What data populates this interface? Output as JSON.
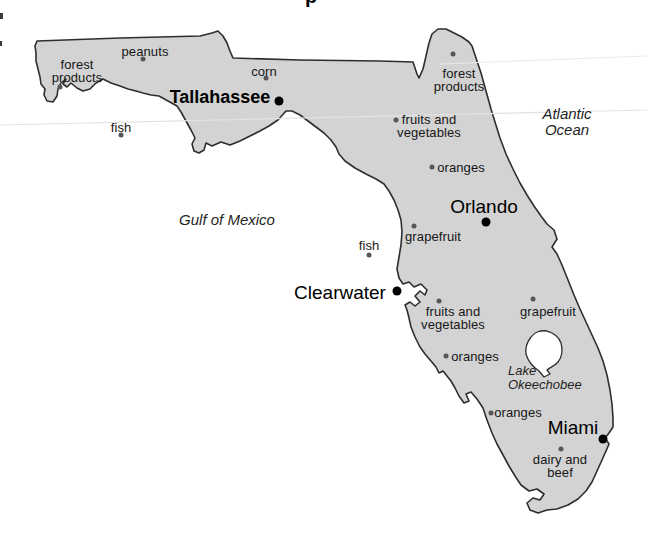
{
  "title_fragment": {
    "text": "p"
  },
  "map": {
    "name": "Florida products map",
    "colors": {
      "land": "#d3d3d3",
      "outline": "#2e2e2e",
      "water": "#ffffff",
      "product_dot": "#565656",
      "city_dot": "#000000",
      "faint_rule": "#e2e2e2"
    },
    "water_labels": [
      {
        "id": "gulf-of-mexico",
        "text": "Gulf of Mexico",
        "x": 227,
        "y": 220,
        "size": 15
      },
      {
        "id": "atlantic-ocean",
        "text": "Atlantic Ocean",
        "x": 567,
        "y": 122,
        "size": 15
      },
      {
        "id": "lake-okeechobee",
        "text": "Lake\nOkeechobee",
        "x": 508,
        "y": 378,
        "size": 13,
        "align": "left"
      }
    ],
    "cities": [
      {
        "id": "tallahassee",
        "name": "Tallahassee",
        "bold": true,
        "size": 18,
        "label": {
          "x": 220,
          "y": 97
        },
        "dot": {
          "x": 279,
          "y": 101
        }
      },
      {
        "id": "orlando",
        "name": "Orlando",
        "bold": false,
        "size": 19,
        "label": {
          "x": 484,
          "y": 206
        },
        "dot": {
          "x": 486,
          "y": 222
        }
      },
      {
        "id": "clearwater",
        "name": "Clearwater",
        "bold": false,
        "size": 19,
        "label": {
          "x": 340,
          "y": 292
        },
        "dot": {
          "x": 397,
          "y": 291
        }
      },
      {
        "id": "miami",
        "name": "Miami",
        "bold": false,
        "size": 19,
        "label": {
          "x": 573,
          "y": 427
        },
        "dot": {
          "x": 603,
          "y": 439
        }
      }
    ],
    "products": [
      {
        "id": "peanuts",
        "text": "peanuts",
        "label": {
          "x": 145,
          "y": 51
        },
        "dot": {
          "x": 143,
          "y": 59
        }
      },
      {
        "id": "forest-products-west",
        "text": "forest\nproducts",
        "label": {
          "x": 77,
          "y": 71
        },
        "dot": {
          "x": 60,
          "y": 87
        }
      },
      {
        "id": "corn",
        "text": "corn",
        "label": {
          "x": 264,
          "y": 71
        },
        "dot": {
          "x": 266,
          "y": 78
        }
      },
      {
        "id": "forest-products-north",
        "text": "forest\nproducts",
        "label": {
          "x": 459,
          "y": 80
        },
        "dot": {
          "x": 453,
          "y": 54
        }
      },
      {
        "id": "fish-panhandle",
        "text": "fish",
        "label": {
          "x": 121,
          "y": 127
        },
        "dot": {
          "x": 121,
          "y": 135
        }
      },
      {
        "id": "fruits-vegetables-north",
        "text": "fruits and\nvegetables",
        "label": {
          "x": 429,
          "y": 126
        },
        "dot": {
          "x": 396,
          "y": 120
        }
      },
      {
        "id": "oranges-north",
        "text": "oranges",
        "label": {
          "x": 461,
          "y": 167
        },
        "dot": {
          "x": 432,
          "y": 167
        }
      },
      {
        "id": "grapefruit-west",
        "text": "grapefruit",
        "label": {
          "x": 433,
          "y": 236
        },
        "dot": {
          "x": 414,
          "y": 226
        }
      },
      {
        "id": "fish-gulf",
        "text": "fish",
        "label": {
          "x": 369,
          "y": 245
        },
        "dot": {
          "x": 369,
          "y": 255
        }
      },
      {
        "id": "fruits-vegetables-tampa",
        "text": "fruits and\nvegetables",
        "label": {
          "x": 453,
          "y": 318
        },
        "dot": {
          "x": 439,
          "y": 301
        }
      },
      {
        "id": "grapefruit-east",
        "text": "grapefruit",
        "label": {
          "x": 548,
          "y": 311
        },
        "dot": {
          "x": 533,
          "y": 299
        }
      },
      {
        "id": "oranges-central",
        "text": "oranges",
        "label": {
          "x": 475,
          "y": 356
        },
        "dot": {
          "x": 446,
          "y": 356
        }
      },
      {
        "id": "oranges-south",
        "text": "oranges",
        "label": {
          "x": 518,
          "y": 412
        },
        "dot": {
          "x": 491,
          "y": 413
        }
      },
      {
        "id": "dairy-beef",
        "text": "dairy and\nbeef",
        "label": {
          "x": 560,
          "y": 466
        },
        "dot": {
          "x": 561,
          "y": 449
        }
      }
    ]
  }
}
